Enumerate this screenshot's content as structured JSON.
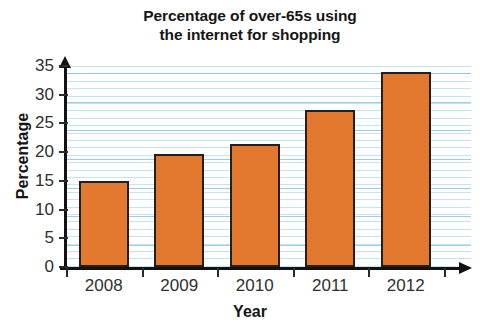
{
  "chart_data": {
    "type": "bar",
    "title": "Percentage of over-65s using the internet for shopping",
    "title_line1": "Percentage of over-65s using",
    "title_line2": "the internet for shopping",
    "xlabel": "Year",
    "ylabel": "Percentage",
    "categories": [
      "2008",
      "2009",
      "2010",
      "2011",
      "2012"
    ],
    "values": [
      15,
      19.7,
      21.4,
      27.4,
      34
    ],
    "ylim": [
      0,
      35
    ],
    "ytick_labels": [
      "0",
      "5",
      "10",
      "15",
      "20",
      "25",
      "30",
      "35"
    ],
    "ytick_values": [
      0,
      5,
      10,
      15,
      20,
      25,
      30,
      35
    ],
    "grid": "horizontal",
    "legend": "none",
    "bar_color": "#e2792e",
    "bar_border_color": "#231f20",
    "gridline_color": "#96cde1",
    "axis_color": "#121212",
    "background_color": "#ffffff"
  }
}
